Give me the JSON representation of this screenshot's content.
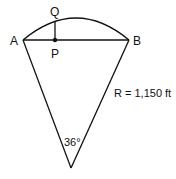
{
  "diagram": {
    "type": "circular-sector-geometry",
    "labels": {
      "A": "A",
      "B": "B",
      "P": "P",
      "Q": "Q",
      "radius": "R = 1,150 ft",
      "angle": "36°"
    },
    "colors": {
      "stroke": "#111111",
      "background": "#ffffff"
    }
  }
}
